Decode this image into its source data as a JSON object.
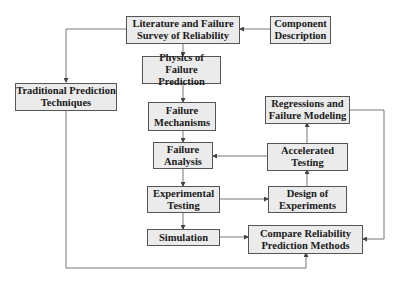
{
  "diagram": {
    "nodes": {
      "literature": "Literature and Failure\nSurvey of Reliability",
      "component": "Component\nDescription",
      "traditional": "Traditional Prediction\nTechniques",
      "physics": "Physics of Failure\nPrediction",
      "mechanisms": "Failure\nMechanisms",
      "analysis": "Failure\nAnalysis",
      "experimental": "Experimental\nTesting",
      "simulation": "Simulation",
      "regressions": "Regressions and\nFailure Modeling",
      "accelerated": "Accelerated\nTesting",
      "design": "Design of\nExperiments",
      "compare": "Compare Reliability\nPrediction Methods"
    },
    "edges": [
      {
        "from": "Component Description",
        "to": "Literature and Failure Survey of Reliability"
      },
      {
        "from": "Literature and Failure Survey of Reliability",
        "to": "Traditional Prediction Techniques"
      },
      {
        "from": "Literature and Failure Survey of Reliability",
        "to": "Physics of Failure Prediction"
      },
      {
        "from": "Physics of Failure Prediction",
        "to": "Failure Mechanisms"
      },
      {
        "from": "Failure Mechanisms",
        "to": "Failure Analysis"
      },
      {
        "from": "Failure Analysis",
        "to": "Experimental Testing"
      },
      {
        "from": "Experimental Testing",
        "to": "Simulation"
      },
      {
        "from": "Experimental Testing",
        "to": "Design of Experiments"
      },
      {
        "from": "Design of Experiments",
        "to": "Accelerated Testing"
      },
      {
        "from": "Accelerated Testing",
        "to": "Failure Analysis"
      },
      {
        "from": "Accelerated Testing",
        "to": "Regressions and Failure Modeling"
      },
      {
        "from": "Regressions and Failure Modeling",
        "to": "Compare Reliability Prediction Methods"
      },
      {
        "from": "Simulation",
        "to": "Compare Reliability Prediction Methods"
      },
      {
        "from": "Traditional Prediction Techniques",
        "to": "Compare Reliability Prediction Methods"
      }
    ],
    "colors": {
      "box_fill": "#ebebeb",
      "box_border": "#555555",
      "line": "#777777"
    }
  }
}
